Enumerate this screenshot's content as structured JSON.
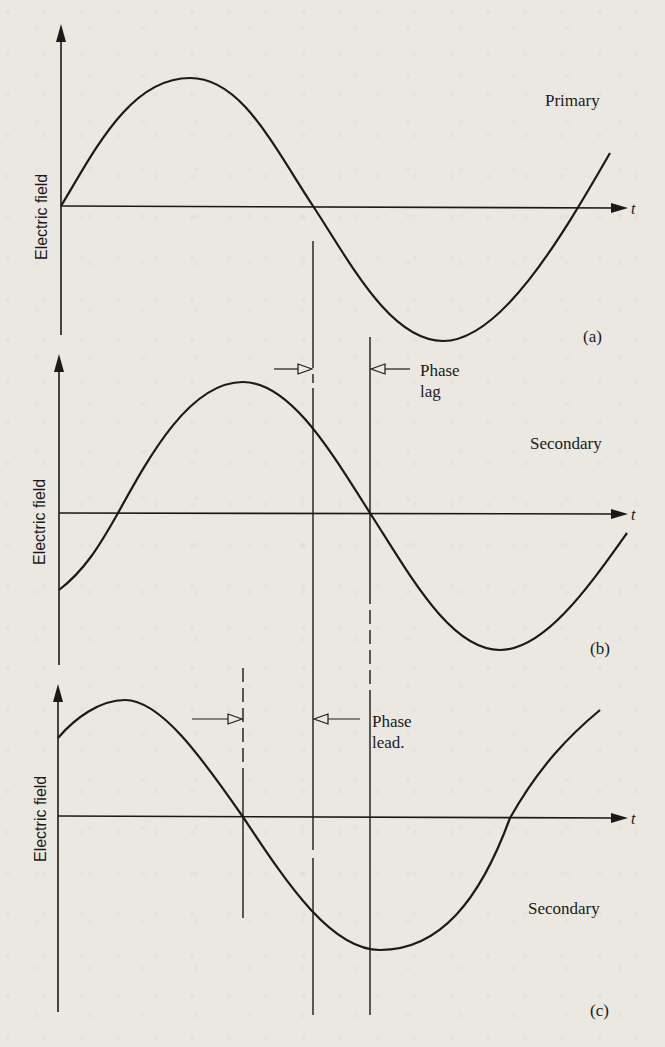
{
  "figure": {
    "panels": [
      {
        "id": "a",
        "tag": "(a)",
        "wave_label": "Primary",
        "y_axis_label": "Electric field",
        "x_axis_label": "t"
      },
      {
        "id": "b",
        "tag": "(b)",
        "wave_label": "Secondary",
        "y_axis_label": "Electric field",
        "x_axis_label": "t",
        "annotation": {
          "line1": "Phase",
          "line2": "lag"
        }
      },
      {
        "id": "c",
        "tag": "(c)",
        "wave_label": "Secondary",
        "y_axis_label": "Electric field",
        "x_axis_label": "t",
        "annotation": {
          "line1": "Phase",
          "line2": "lead."
        }
      }
    ]
  },
  "colors": {
    "background": "#ebe8e2",
    "ink": "#1a1a1a"
  }
}
